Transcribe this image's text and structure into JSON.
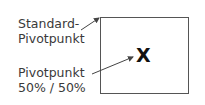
{
  "labels": {
    "default_pivot": [
      "Standard-",
      "Pivotpunkt"
    ],
    "center_pivot": [
      "Pivotpunkt",
      "50% / 50%"
    ]
  },
  "pivot_marker": "X",
  "colors": {
    "box_border": "#555555",
    "arrow": "#444444",
    "text": "#3a3a3a"
  }
}
